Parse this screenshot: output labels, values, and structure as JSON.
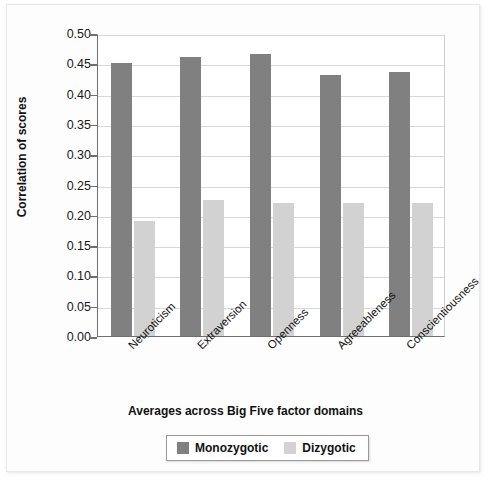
{
  "chart_data": {
    "type": "bar",
    "title": "",
    "xlabel": "Averages across Big Five factor domains",
    "ylabel": "Correlation of scores",
    "categories": [
      "Neuroticism",
      "Extraversion",
      "Openness",
      "Agreeableness",
      "Conscientiousness"
    ],
    "series": [
      {
        "name": "Monozygotic",
        "color": "#808080",
        "values": [
          0.45,
          0.46,
          0.465,
          0.43,
          0.435
        ]
      },
      {
        "name": "Dizygotic",
        "color": "#d2d2d2",
        "values": [
          0.19,
          0.225,
          0.22,
          0.219,
          0.22
        ]
      }
    ],
    "ylim": [
      0.0,
      0.5
    ],
    "yticks": [
      0.0,
      0.05,
      0.1,
      0.15,
      0.2,
      0.25,
      0.3,
      0.35,
      0.4,
      0.45,
      0.5
    ],
    "ytick_labels": [
      "0.00",
      "0.05",
      "0.10",
      "0.15",
      "0.20",
      "0.25",
      "0.30",
      "0.35",
      "0.40",
      "0.45",
      "0.50"
    ],
    "grid": "horizontal",
    "legend_position": "bottom-center",
    "xtick_label_rotation": -45
  }
}
